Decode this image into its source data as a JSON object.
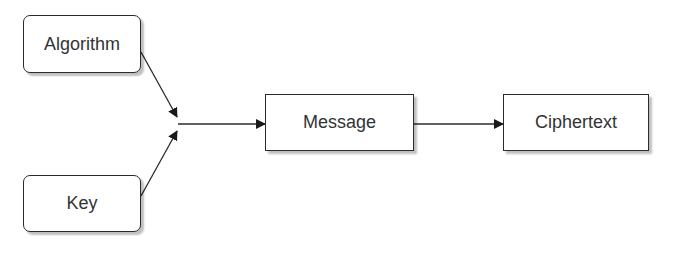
{
  "diagram": {
    "nodes": [
      {
        "id": "algorithm",
        "label": "Algorithm",
        "shape": "rounded-rect"
      },
      {
        "id": "key",
        "label": "Key",
        "shape": "rounded-rect"
      },
      {
        "id": "message",
        "label": "Message",
        "shape": "rect"
      },
      {
        "id": "ciphertext",
        "label": "Ciphertext",
        "shape": "rect"
      }
    ],
    "edges": [
      {
        "from": "algorithm",
        "to": "junction"
      },
      {
        "from": "key",
        "to": "junction"
      },
      {
        "from": "junction",
        "to": "message"
      },
      {
        "from": "message",
        "to": "ciphertext"
      }
    ],
    "colors": {
      "stroke": "#2b2b2b",
      "text": "#333333",
      "background": "#ffffff"
    }
  }
}
